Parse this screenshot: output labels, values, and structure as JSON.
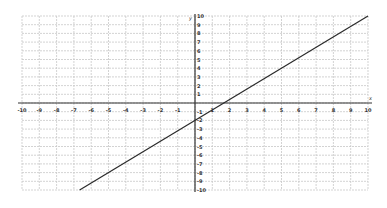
{
  "chart_data": {
    "type": "line",
    "title": "",
    "xlabel": "x",
    "ylabel": "y",
    "xlim": [
      -10,
      10
    ],
    "ylim": [
      -10,
      10
    ],
    "grid": true,
    "x_ticks": [
      -10,
      -9,
      -8,
      -7,
      -6,
      -5,
      -4,
      -3,
      -2,
      -1,
      1,
      2,
      3,
      4,
      5,
      6,
      7,
      8,
      9,
      10
    ],
    "y_ticks": [
      -10,
      -9,
      -8,
      -7,
      -6,
      -5,
      -4,
      -3,
      -2,
      -1,
      1,
      2,
      3,
      4,
      5,
      6,
      7,
      8,
      9,
      10
    ],
    "series": [
      {
        "name": "line",
        "equation": "y = 1.2x - 2",
        "x": [
          -6.67,
          10
        ],
        "y": [
          -10,
          10
        ]
      }
    ]
  },
  "colors": {
    "grid": "#c8c8c8",
    "axis": "#333333",
    "line": "#2a2a2a",
    "background": "#ffffff"
  }
}
